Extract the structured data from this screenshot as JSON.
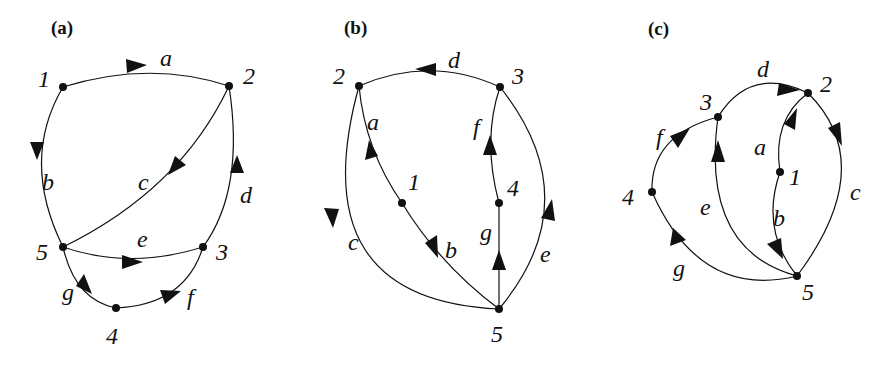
{
  "figure": {
    "panels": [
      {
        "id": "a",
        "label": "(a)",
        "nodes": [
          {
            "id": "1",
            "label": "1",
            "x": 63,
            "y": 87
          },
          {
            "id": "2",
            "label": "2",
            "x": 229,
            "y": 86
          },
          {
            "id": "3",
            "label": "3",
            "x": 203,
            "y": 247
          },
          {
            "id": "4",
            "label": "4",
            "x": 116,
            "y": 308
          },
          {
            "id": "5",
            "label": "5",
            "x": 63,
            "y": 247
          }
        ],
        "edges": [
          {
            "label": "a",
            "from": "1",
            "to": "2"
          },
          {
            "label": "b",
            "from": "1",
            "to": "5"
          },
          {
            "label": "c",
            "from": "2",
            "to": "5"
          },
          {
            "label": "d",
            "from": "3",
            "to": "2"
          },
          {
            "label": "e",
            "from": "5",
            "to": "3"
          },
          {
            "label": "f",
            "from": "4",
            "to": "3"
          },
          {
            "label": "g",
            "from": "5",
            "to": "4"
          }
        ]
      },
      {
        "id": "b",
        "label": "(b)",
        "nodes": [
          {
            "id": "1",
            "label": "1",
            "x": 402,
            "y": 203
          },
          {
            "id": "2",
            "label": "2",
            "x": 359,
            "y": 86
          },
          {
            "id": "3",
            "label": "3",
            "x": 500,
            "y": 87
          },
          {
            "id": "4",
            "label": "4",
            "x": 499,
            "y": 203
          },
          {
            "id": "5",
            "label": "5",
            "x": 499,
            "y": 309
          }
        ],
        "edges": [
          {
            "label": "a",
            "from": "1",
            "to": "2"
          },
          {
            "label": "b",
            "from": "1",
            "to": "5"
          },
          {
            "label": "c",
            "from": "2",
            "to": "5"
          },
          {
            "label": "d",
            "from": "3",
            "to": "2"
          },
          {
            "label": "e",
            "from": "5",
            "to": "3"
          },
          {
            "label": "f",
            "from": "4",
            "to": "3"
          },
          {
            "label": "g",
            "from": "5",
            "to": "4"
          }
        ]
      },
      {
        "id": "c",
        "label": "(c)",
        "nodes": [
          {
            "id": "1",
            "label": "1",
            "x": 780,
            "y": 172
          },
          {
            "id": "2",
            "label": "2",
            "x": 808,
            "y": 93
          },
          {
            "id": "3",
            "label": "3",
            "x": 718,
            "y": 117
          },
          {
            "id": "4",
            "label": "4",
            "x": 652,
            "y": 192
          },
          {
            "id": "5",
            "label": "5",
            "x": 797,
            "y": 276
          }
        ],
        "edges": [
          {
            "label": "a",
            "from": "1",
            "to": "2"
          },
          {
            "label": "b",
            "from": "1",
            "to": "5"
          },
          {
            "label": "c",
            "from": "2",
            "to": "5"
          },
          {
            "label": "d",
            "from": "3",
            "to": "2"
          },
          {
            "label": "e",
            "from": "5",
            "to": "3"
          },
          {
            "label": "f",
            "from": "4",
            "to": "3"
          },
          {
            "label": "g",
            "from": "5",
            "to": "4"
          }
        ]
      }
    ]
  },
  "labels": {
    "a": {
      "panel": "(a)",
      "n1": "1",
      "n2": "2",
      "n3": "3",
      "n4": "4",
      "n5": "5",
      "ea": "a",
      "eb": "b",
      "ec": "c",
      "ed": "d",
      "ee": "e",
      "ef": "f",
      "eg": "g"
    },
    "b": {
      "panel": "(b)",
      "n1": "1",
      "n2": "2",
      "n3": "3",
      "n4": "4",
      "n5": "5",
      "ea": "a",
      "eb": "b",
      "ec": "c",
      "ed": "d",
      "ee": "e",
      "ef": "f",
      "eg": "g"
    },
    "c": {
      "panel": "(c)",
      "n1": "1",
      "n2": "2",
      "n3": "3",
      "n4": "4",
      "n5": "5",
      "ea": "a",
      "eb": "b",
      "ec": "c",
      "ed": "d",
      "ee": "e",
      "ef": "f",
      "eg": "g"
    }
  }
}
